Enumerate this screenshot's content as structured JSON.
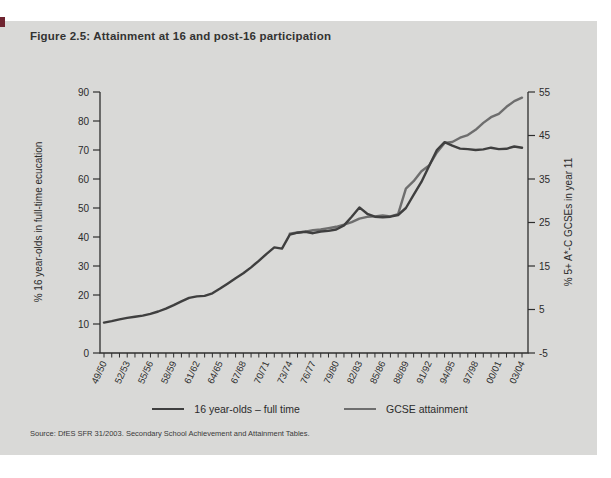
{
  "figure": {
    "title": "Figure 2.5: Attainment at 16 and post-16 participation",
    "source": "Source: DfES SFR 31/2003. Secondary School Achievement and Attainment Tables."
  },
  "colors": {
    "panel_background": "#d9d9d7",
    "axis": "#2e2e2e",
    "edge_notch": "#6f2430"
  },
  "chart_data": {
    "type": "line",
    "title": "Figure 2.5: Attainment at 16 and post-16 participation",
    "grid": false,
    "legend_position": "bottom",
    "x_tick_labels": [
      "49/50",
      "52/53",
      "55/56",
      "58/59",
      "61/62",
      "64/65",
      "67/68",
      "70/71",
      "73/74",
      "76/77",
      "79/80",
      "82/83",
      "85/86",
      "88/89",
      "91/92",
      "94/95",
      "97/98",
      "00/01",
      "03/04"
    ],
    "x_minor_tick_count": 55,
    "left_axis": {
      "label": "% 16 year-olds in full-time ecucation",
      "min": 0,
      "max": 90,
      "tick_step": 10,
      "tick_labels": [
        0,
        10,
        20,
        30,
        40,
        50,
        60,
        70,
        80,
        90
      ]
    },
    "right_axis": {
      "label": "% 5+ A*-C GCSEs in year 11",
      "min": -5,
      "max": 55,
      "tick_step": 10,
      "tick_labels": [
        -5,
        5,
        15,
        25,
        35,
        45,
        55
      ]
    },
    "series": [
      {
        "name": "16 year-olds – full time",
        "axis": "left",
        "color": "#3f3f3f",
        "start_index": 0,
        "values": [
          10.5,
          11.0,
          11.6,
          12.1,
          12.5,
          12.9,
          13.5,
          14.3,
          15.3,
          16.5,
          17.8,
          19.0,
          19.5,
          19.7,
          20.6,
          22.2,
          24.0,
          25.8,
          27.5,
          29.5,
          31.8,
          34.2,
          36.4,
          36.0,
          40.8,
          41.5,
          41.8,
          41.3,
          41.9,
          42.1,
          42.6,
          44.0,
          47.0,
          50.2,
          48.0,
          47.0,
          46.8,
          47.0,
          47.6,
          50.0,
          54.5,
          59.0,
          64.5,
          70.0,
          72.7,
          71.5,
          70.5,
          70.3,
          70.0,
          70.2,
          70.8,
          70.3,
          70.4,
          71.2,
          70.8
        ]
      },
      {
        "name": "GCSE attainment",
        "axis": "right",
        "color": "#6e6e6e",
        "start_index": 24,
        "values": [
          22.4,
          22.7,
          22.9,
          23.2,
          23.4,
          23.7,
          24.0,
          24.5,
          25.1,
          25.9,
          26.3,
          26.4,
          26.6,
          26.4,
          26.9,
          32.8,
          34.5,
          36.8,
          38.1,
          41.1,
          43.3,
          43.5,
          44.5,
          45.1,
          46.3,
          47.9,
          49.2,
          50.0,
          51.6,
          52.9,
          53.7
        ]
      }
    ]
  }
}
